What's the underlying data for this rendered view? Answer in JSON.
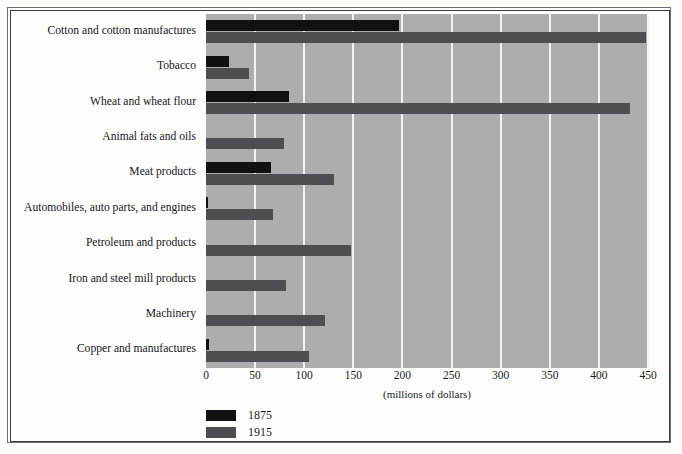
{
  "chart_data": {
    "type": "bar",
    "orientation": "horizontal",
    "title": "",
    "xlabel": "(millions of dollars)",
    "ylabel": "",
    "xlim": [
      0,
      450
    ],
    "xticks": [
      0,
      50,
      100,
      150,
      200,
      250,
      300,
      350,
      400,
      450
    ],
    "grid": true,
    "legend_position": "below-left",
    "categories": [
      "Cotton and cotton manufactures",
      "Tobacco",
      "Wheat and wheat flour",
      "Animal fats and oils",
      "Meat products",
      "Automobiles, auto parts, and engines",
      "Petroleum and products",
      "Iron and steel mill products",
      "Machinery",
      "Copper and manufactures"
    ],
    "series": [
      {
        "name": "1875",
        "color": "#111114",
        "values": [
          196,
          23,
          85,
          0,
          66,
          2,
          0,
          0,
          0,
          3
        ]
      },
      {
        "name": "1915",
        "color": "#4e4e52",
        "values": [
          448,
          44,
          432,
          79,
          130,
          68,
          148,
          81,
          121,
          105
        ]
      }
    ]
  },
  "axis": {
    "x_title": "(millions of dollars)",
    "tick_labels": [
      "0",
      "50",
      "100",
      "150",
      "200",
      "250",
      "300",
      "350",
      "400",
      "450"
    ]
  },
  "legend": {
    "items": [
      {
        "label": "1875",
        "color": "#111114"
      },
      {
        "label": "1915",
        "color": "#4e4e52"
      }
    ]
  },
  "colors": {
    "plot_background": "#adadad",
    "gridline": "#f2f2f0",
    "page_background": "#fdfdfc",
    "series_1875": "#111114",
    "series_1915": "#4e4e52",
    "frame_outer": "#6e6e72",
    "frame_inner": "#3a3a40"
  }
}
